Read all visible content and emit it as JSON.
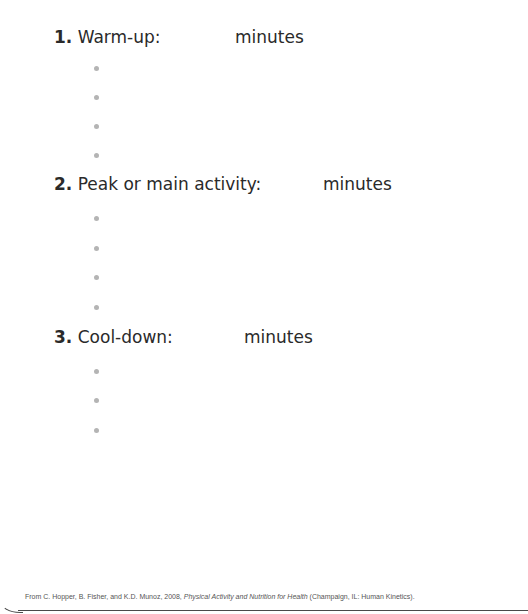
{
  "sections": [
    {
      "number": "1.",
      "label": "Warm-up:",
      "unit": "minutes",
      "bullet_count": 4
    },
    {
      "number": "2.",
      "label": "Peak or main activity:",
      "unit": "minutes",
      "bullet_count": 4
    },
    {
      "number": "3.",
      "label": "Cool-down:",
      "unit": "minutes",
      "bullet_count": 3
    }
  ],
  "citation": {
    "prefix": "From C. Hopper, B. Fisher, and K.D. Munoz, 2008, ",
    "title": "Physical Activity and Nutrition for Health",
    "suffix": " (Champaign, IL: Human Kinetics)."
  },
  "colors": {
    "text": "#2a2a2a",
    "bullet": "#b4b4b4",
    "rule": "#4a4a4a"
  }
}
